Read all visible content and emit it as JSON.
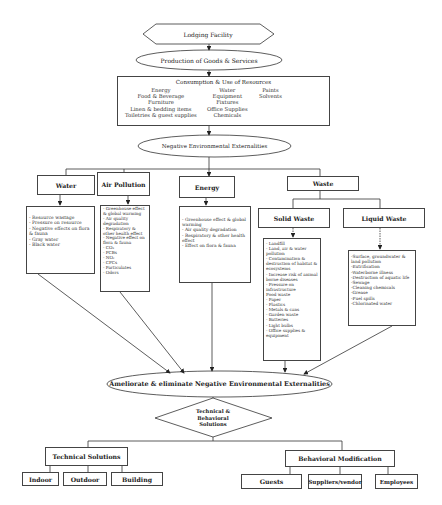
{
  "top": {
    "facility": "Lodging Facility",
    "production": "Production of Goods & Services"
  },
  "consumption": {
    "title": "Consumption & Use of Resources",
    "col1": [
      "Energy",
      "Food & Beverage",
      "Furniture",
      "Linen & bedding items",
      "Toiletries & guest supplies"
    ],
    "col2": [
      "Water",
      "Equipment",
      "Fixtures",
      "Office Supplies",
      "Chemicals"
    ],
    "col3": [
      "Paints",
      "Solvents"
    ]
  },
  "externalities": {
    "label": "Negative Environmental Externalities",
    "categories": {
      "water": "Water",
      "air": "Air Pollution",
      "energy": "Energy",
      "waste": "Waste",
      "solid": "Solid Waste",
      "liquid": "Liquid Waste"
    },
    "water_items": [
      "- Resource wastage",
      "- Pressure on resource",
      "- Negative effects on flora & fauna",
      "- Gray water",
      "- Black water"
    ],
    "air_items": [
      "- Greenhouse effect & global warming",
      "- Air quality degradation",
      "- Respiratory & other health effect",
      "- Negative effect on flora & fauna",
      "- CO₂",
      "- PCBs",
      "- NOₓ",
      "- CFCs",
      "- Particulates",
      "- Odors"
    ],
    "energy_items": [
      "- Greenhouse effect & global warming",
      "- Air quality degradation",
      "- Respiratory & other health effect",
      "- Effect on flora & fauna"
    ],
    "solid_items": [
      "- Landfill",
      "- Land, air & water pollution",
      "- Contamination & destruction of habitat & ecosystems",
      "- Increase risk of animal borne diseases",
      "- Pressure on infrastructure",
      "Food waste",
      "- Paper",
      "- Plastics",
      "- Metals & cans",
      "- Garden waste",
      "- Batteries",
      "- Light bulbs",
      "- Office supplies & equipment"
    ],
    "liquid_items": [
      "-Surface, groundwater & land pollution",
      "-Eutrification",
      "-Waterborne illness",
      "-Destruction of aquatic life",
      "-Sewage",
      "-Cleaning chemicals",
      "-Grease",
      "-Fuel spills",
      "-Chlorinated water"
    ]
  },
  "solutions": {
    "ameliorate": "Ameliorate & eliminate Negative Environmental Externalities",
    "decision": "Technical & Behavioral Solutions",
    "technical": {
      "label": "Technical Solutions",
      "children": [
        "Indoor",
        "Outdoor",
        "Building"
      ]
    },
    "behavioral": {
      "label": "Behavioral Modification",
      "children": [
        "Guests",
        "Suppliers/vendor",
        "Employees"
      ]
    }
  }
}
